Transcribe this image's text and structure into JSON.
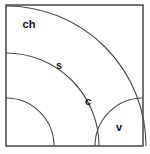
{
  "diagram": {
    "title": "",
    "background_color": "#ffffff",
    "frame": {
      "stroke_color": "#3a3a3a",
      "x": 6,
      "y": 5,
      "width": 137,
      "height": 141
    },
    "arc_center": {
      "x": 6,
      "y": 146
    },
    "arc_stroke_color": "#4a4a4a",
    "regions": [
      {
        "id": "ch",
        "label": "ch",
        "radius": 140,
        "label_x": 29,
        "label_y": 25
      },
      {
        "id": "s",
        "label": "s",
        "radius": 93,
        "label_x": 59,
        "label_y": 66
      },
      {
        "id": "c",
        "label": "c",
        "radius": 48,
        "label_x": 88,
        "label_y": 102
      },
      {
        "id": "v",
        "label": "v",
        "radius": 0,
        "label_x": 119,
        "label_y": 128
      }
    ],
    "inner_arc": {
      "id": "v-boundary",
      "center_x": 6,
      "center_y": 146,
      "radius": 48
    }
  }
}
